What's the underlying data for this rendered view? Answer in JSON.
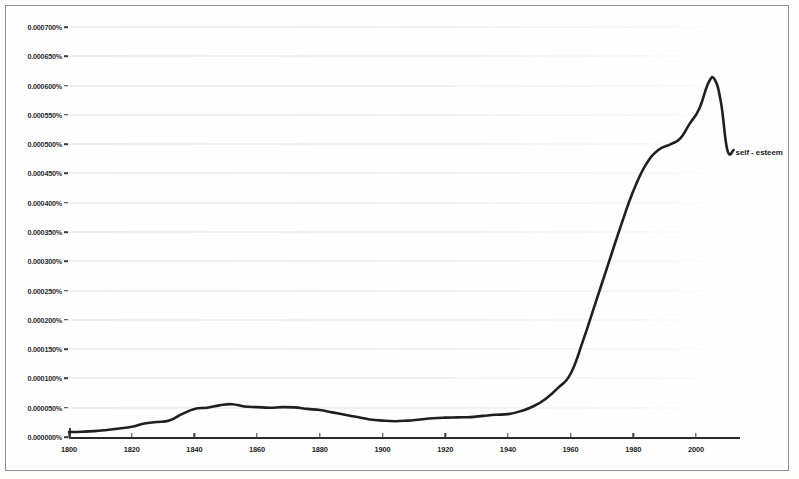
{
  "chart_data": {
    "type": "line",
    "title": "",
    "subtitle": "",
    "xlabel": "",
    "ylabel": "",
    "grid": true,
    "legend_position": "inline-right-end",
    "xlim": [
      1800,
      2012
    ],
    "ylim": [
      0.0,
      0.0007
    ],
    "y_tick_labels": [
      "0.000700%",
      "0.000650%",
      "0.000600%",
      "0.000550%",
      "0.000500%",
      "0.000450%",
      "0.000400%",
      "0.000350%",
      "0.000300%",
      "0.000250%",
      "0.000200%",
      "0.000150%",
      "0.000100%",
      "0.000050%",
      "0.000000%"
    ],
    "y_tick_values": [
      0.0007,
      0.00065,
      0.0006,
      0.00055,
      0.0005,
      0.00045,
      0.0004,
      0.00035,
      0.0003,
      0.00025,
      0.0002,
      0.00015,
      0.0001,
      5e-05,
      0.0
    ],
    "x_tick_labels": [
      "1800",
      "1820",
      "1840",
      "1860",
      "1880",
      "1900",
      "1920",
      "1940",
      "1960",
      "1980",
      "2000"
    ],
    "x_tick_values": [
      1800,
      1820,
      1840,
      1860,
      1880,
      1900,
      1920,
      1940,
      1960,
      1980,
      2000
    ],
    "series": [
      {
        "name": "self - esteem",
        "color": "#1f1f1f",
        "x": [
          1800,
          1804,
          1808,
          1812,
          1816,
          1820,
          1824,
          1828,
          1832,
          1836,
          1840,
          1844,
          1848,
          1852,
          1856,
          1860,
          1864,
          1868,
          1872,
          1876,
          1880,
          1884,
          1888,
          1892,
          1896,
          1900,
          1904,
          1908,
          1912,
          1916,
          1920,
          1924,
          1928,
          1932,
          1936,
          1940,
          1944,
          1948,
          1952,
          1956,
          1960,
          1964,
          1968,
          1972,
          1976,
          1980,
          1984,
          1988,
          1992,
          1995,
          1998,
          2001,
          2004,
          2006,
          2008,
          2010,
          2012
        ],
        "y": [
          8.5e-06,
          9e-06,
          1e-05,
          1.2e-05,
          1.45e-05,
          1.75e-05,
          2.3e-05,
          2.55e-05,
          2.8e-05,
          3.9e-05,
          4.8e-05,
          5e-05,
          5.4e-05,
          5.6e-05,
          5.2e-05,
          5.1e-05,
          5e-05,
          5.1e-05,
          5.05e-05,
          4.8e-05,
          4.6e-05,
          4.2e-05,
          3.8e-05,
          3.4e-05,
          3e-05,
          2.8e-05,
          2.7e-05,
          2.8e-05,
          3e-05,
          3.2e-05,
          3.3e-05,
          3.35e-05,
          3.4e-05,
          3.6e-05,
          3.8e-05,
          3.9e-05,
          4.4e-05,
          5.2e-05,
          6.5e-05,
          8.4e-05,
          0.000108,
          0.000165,
          0.00023,
          0.000295,
          0.00036,
          0.00042,
          0.000465,
          0.00049,
          0.0005,
          0.00051,
          0.000535,
          0.00056,
          0.000605,
          0.00061,
          0.00057,
          0.00049,
          0.00049
        ]
      }
    ],
    "annotations": [
      {
        "text": "self - esteem",
        "x": 2012,
        "y": 0.000485
      }
    ]
  },
  "legend": {
    "series_label": "self - esteem"
  }
}
